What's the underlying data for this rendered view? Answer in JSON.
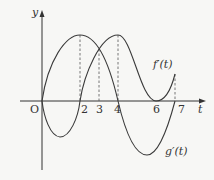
{
  "diagram": {
    "axes": {
      "x_label": "t",
      "y_label": "y",
      "origin_label": "O"
    },
    "ticks": [
      {
        "value": 2,
        "label": "2"
      },
      {
        "value": 3,
        "label": "3"
      },
      {
        "value": 4,
        "label": "4"
      },
      {
        "value": 6,
        "label": "6"
      },
      {
        "value": 7,
        "label": "7"
      }
    ],
    "curves": [
      {
        "name": "f_prime",
        "label": "f′(t)",
        "description": "starts at O, peaks at t=4, touches t-axis at t=6, rises to t=7"
      },
      {
        "name": "g_prime",
        "label": "g′(t)",
        "description": "starts at O rising, peaks at t=2, crosses zero at t=4, minimum between 4 and 7"
      }
    ],
    "dashed_guides_at": [
      2,
      3,
      4,
      7
    ],
    "colors": {
      "curve": "#3a3a3a",
      "axis": "#333333",
      "dashed": "#555555",
      "background": "#f7f7f5"
    }
  }
}
